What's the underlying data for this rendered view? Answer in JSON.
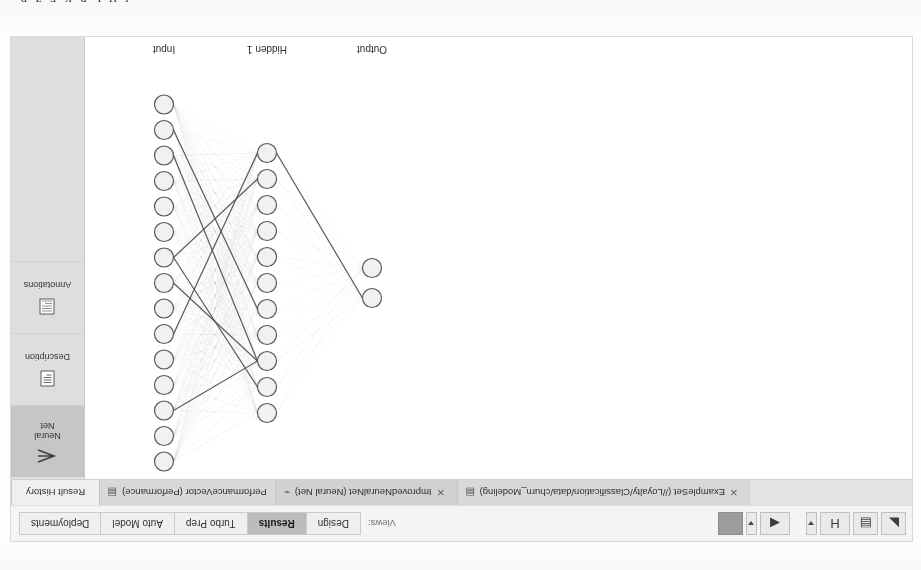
{
  "scan": {
    "bleed_text": "ɪ ʜ ʟ ʀ ᴋ ᴇ ᴢ ʀ"
  },
  "toolbar": {
    "buttons": [
      {
        "name": "new-process-button",
        "icon": "page-icon",
        "glyph": "◣"
      },
      {
        "name": "open-process-button",
        "icon": "folder-icon",
        "glyph": "▤"
      },
      {
        "name": "save-process-button",
        "icon": "save-icon",
        "glyph": "H"
      },
      {
        "name": "save-dropdown-button",
        "icon": "chevron-down-icon",
        "glyph": "▾"
      },
      {
        "name": "run-process-button",
        "icon": "play-icon",
        "glyph": "◀"
      },
      {
        "name": "run-dropdown-button",
        "icon": "chevron-down-icon",
        "glyph": "▾"
      },
      {
        "name": "stop-process-button",
        "icon": "stop-icon",
        "glyph": "■"
      }
    ],
    "views_label": "Views:",
    "view_tabs": [
      {
        "label": "Design",
        "active": false
      },
      {
        "label": "Results",
        "active": true
      },
      {
        "label": "Turbo Prep",
        "active": false
      },
      {
        "label": "Auto Model",
        "active": false
      },
      {
        "label": "Deployments",
        "active": false
      }
    ],
    "find_placeholder": "Find data, operato..."
  },
  "result_tabs": [
    {
      "label": "Result History",
      "icon": "",
      "closable": false,
      "active": false,
      "kind": "history"
    },
    {
      "label": "PerformanceVector (Performance)",
      "icon": "table-icon",
      "glyph": "▤",
      "closable": true,
      "active": false,
      "kind": "result"
    },
    {
      "label": "ImprovedNeuralNet (Neural Net)",
      "icon": "model-icon",
      "glyph": "⌁",
      "closable": true,
      "active": true,
      "kind": "result"
    },
    {
      "label": "ExampleSet (//Loyalty/Classification/data/churn_Modeling)",
      "icon": "table-icon",
      "glyph": "▤",
      "closable": true,
      "active": false,
      "kind": "result"
    }
  ],
  "side_panel": {
    "items": [
      {
        "label": "Neural\nNet",
        "icon": "neural-net-icon",
        "active": true
      },
      {
        "label": "Description",
        "icon": "description-icon",
        "active": false
      },
      {
        "label": "Annotations",
        "icon": "annotations-icon",
        "active": false
      }
    ]
  },
  "network": {
    "layer_labels": [
      "Input",
      "Hidden 1",
      "Output"
    ],
    "layers": [
      {
        "name": "Input",
        "node_count": 15
      },
      {
        "name": "Hidden 1",
        "node_count": 11
      },
      {
        "name": "Output",
        "node_count": 2
      }
    ],
    "node_fill": "#f0f0f0",
    "node_stroke": "#555555",
    "edge_color": "#808080"
  }
}
